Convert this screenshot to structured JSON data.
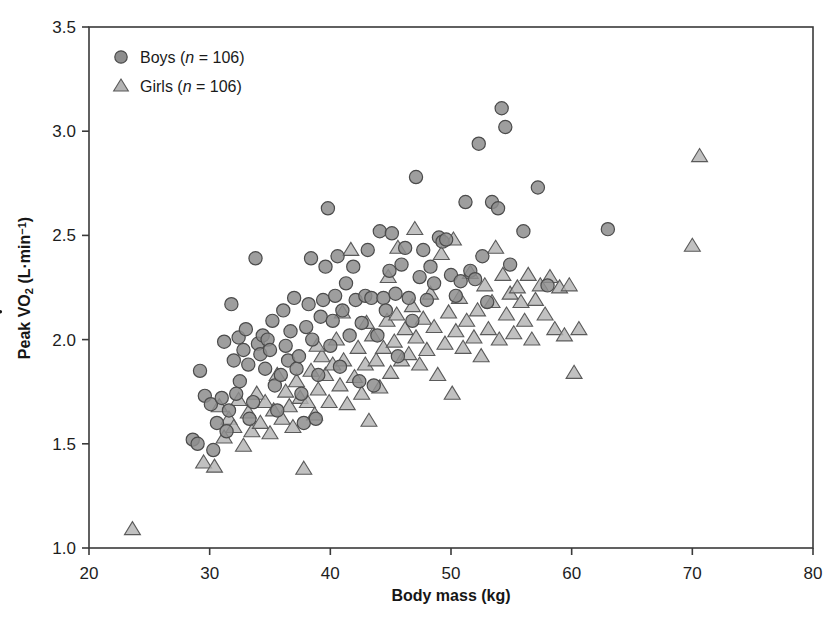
{
  "chart_data": {
    "type": "scatter",
    "title": "",
    "xlabel": "Body mass (kg)",
    "ylabel": "Peak VO2 (L·min⁻¹)",
    "ylabel_parts": {
      "prefix": "Peak ",
      "v_dot": "V",
      "o": "O",
      "sub": "2",
      "units": " (L·min",
      "exp": "−1",
      "close": ")"
    },
    "xlim": [
      20,
      80
    ],
    "ylim": [
      1.0,
      3.5
    ],
    "xticks": [
      20,
      30,
      40,
      50,
      60,
      70,
      80
    ],
    "yticks": [
      1.0,
      1.5,
      2.0,
      2.5,
      3.0,
      3.5
    ],
    "xtick_labels": [
      "20",
      "30",
      "40",
      "50",
      "60",
      "70",
      "80"
    ],
    "ytick_labels": [
      "1.0",
      "1.5",
      "2.0",
      "2.5",
      "3.0",
      "3.5"
    ],
    "grid": false,
    "legend_position": "top-left",
    "marker_colors": {
      "boys_fill": "#8d8d8d",
      "boys_edge": "#4b4b4b",
      "girls_fill": "#b3b3b3",
      "girls_edge": "#5a5a5a",
      "frame": "#3a3a3a"
    },
    "series": [
      {
        "name": "Boys",
        "n": 106,
        "legend_label_prefix": "Boys (",
        "legend_label_italic": "n",
        "legend_label_suffix": " = 106)",
        "marker": "circle",
        "points": [
          [
            28.6,
            1.52
          ],
          [
            29.0,
            1.5
          ],
          [
            29.2,
            1.85
          ],
          [
            29.6,
            1.73
          ],
          [
            30.1,
            1.69
          ],
          [
            30.3,
            1.47
          ],
          [
            30.6,
            1.6
          ],
          [
            31.0,
            1.72
          ],
          [
            31.2,
            1.99
          ],
          [
            31.4,
            1.56
          ],
          [
            31.6,
            1.66
          ],
          [
            31.8,
            2.17
          ],
          [
            32.0,
            1.9
          ],
          [
            32.2,
            1.74
          ],
          [
            32.4,
            2.01
          ],
          [
            32.5,
            1.8
          ],
          [
            32.8,
            1.95
          ],
          [
            33.0,
            2.05
          ],
          [
            33.2,
            1.88
          ],
          [
            33.3,
            1.62
          ],
          [
            33.6,
            1.7
          ],
          [
            33.8,
            2.39
          ],
          [
            34.0,
            1.98
          ],
          [
            34.2,
            1.93
          ],
          [
            34.4,
            2.02
          ],
          [
            34.6,
            1.86
          ],
          [
            34.8,
            2.0
          ],
          [
            35.0,
            1.95
          ],
          [
            35.2,
            2.09
          ],
          [
            35.4,
            1.78
          ],
          [
            35.6,
            1.66
          ],
          [
            35.9,
            1.83
          ],
          [
            36.1,
            2.14
          ],
          [
            36.3,
            1.97
          ],
          [
            36.5,
            1.9
          ],
          [
            36.7,
            2.04
          ],
          [
            37.0,
            2.2
          ],
          [
            37.2,
            1.86
          ],
          [
            37.4,
            1.92
          ],
          [
            37.6,
            1.74
          ],
          [
            37.8,
            1.6
          ],
          [
            38.0,
            2.06
          ],
          [
            38.2,
            2.17
          ],
          [
            38.4,
            2.39
          ],
          [
            38.5,
            2.0
          ],
          [
            38.8,
            1.62
          ],
          [
            39.0,
            1.83
          ],
          [
            39.2,
            2.11
          ],
          [
            39.4,
            2.19
          ],
          [
            39.6,
            2.35
          ],
          [
            39.8,
            2.63
          ],
          [
            40.0,
            1.97
          ],
          [
            40.2,
            2.09
          ],
          [
            40.4,
            2.21
          ],
          [
            40.6,
            2.4
          ],
          [
            40.8,
            1.87
          ],
          [
            41.0,
            2.14
          ],
          [
            41.3,
            2.27
          ],
          [
            41.6,
            2.02
          ],
          [
            41.9,
            2.35
          ],
          [
            42.1,
            2.19
          ],
          [
            42.4,
            1.8
          ],
          [
            42.6,
            2.08
          ],
          [
            42.9,
            2.21
          ],
          [
            43.1,
            2.43
          ],
          [
            43.4,
            2.2
          ],
          [
            43.6,
            1.78
          ],
          [
            43.9,
            2.02
          ],
          [
            44.1,
            2.52
          ],
          [
            44.4,
            2.2
          ],
          [
            44.6,
            2.14
          ],
          [
            44.9,
            2.33
          ],
          [
            45.1,
            2.51
          ],
          [
            45.4,
            2.22
          ],
          [
            45.6,
            1.92
          ],
          [
            45.9,
            2.36
          ],
          [
            46.2,
            2.44
          ],
          [
            46.5,
            2.2
          ],
          [
            46.8,
            2.09
          ],
          [
            47.1,
            2.78
          ],
          [
            47.4,
            2.3
          ],
          [
            47.7,
            2.43
          ],
          [
            48.0,
            2.19
          ],
          [
            48.3,
            2.35
          ],
          [
            48.6,
            2.27
          ],
          [
            49.0,
            2.49
          ],
          [
            49.3,
            2.47
          ],
          [
            49.6,
            2.48
          ],
          [
            50.0,
            2.31
          ],
          [
            50.4,
            2.21
          ],
          [
            50.8,
            2.28
          ],
          [
            51.2,
            2.66
          ],
          [
            51.6,
            2.33
          ],
          [
            52.0,
            2.29
          ],
          [
            52.3,
            2.94
          ],
          [
            52.6,
            2.4
          ],
          [
            53.0,
            2.18
          ],
          [
            53.4,
            2.66
          ],
          [
            53.9,
            2.63
          ],
          [
            54.2,
            3.11
          ],
          [
            54.5,
            3.02
          ],
          [
            54.9,
            2.36
          ],
          [
            56.0,
            2.52
          ],
          [
            57.2,
            2.73
          ],
          [
            58.0,
            2.26
          ],
          [
            63.0,
            2.53
          ]
        ]
      },
      {
        "name": "Girls",
        "n": 106,
        "legend_label_prefix": "Girls (",
        "legend_label_italic": "n",
        "legend_label_suffix": " = 106)",
        "marker": "triangle",
        "points": [
          [
            23.6,
            1.09
          ],
          [
            29.5,
            1.41
          ],
          [
            30.4,
            1.39
          ],
          [
            30.8,
            1.68
          ],
          [
            31.2,
            1.53
          ],
          [
            31.6,
            1.62
          ],
          [
            32.0,
            1.58
          ],
          [
            32.4,
            1.71
          ],
          [
            32.8,
            1.49
          ],
          [
            33.2,
            1.65
          ],
          [
            33.5,
            1.56
          ],
          [
            33.9,
            1.74
          ],
          [
            34.2,
            1.6
          ],
          [
            34.6,
            1.7
          ],
          [
            35.0,
            1.55
          ],
          [
            35.3,
            1.66
          ],
          [
            35.6,
            1.83
          ],
          [
            36.0,
            1.62
          ],
          [
            36.3,
            1.75
          ],
          [
            36.6,
            1.68
          ],
          [
            36.9,
            1.58
          ],
          [
            37.2,
            1.8
          ],
          [
            37.5,
            1.72
          ],
          [
            37.8,
            1.38
          ],
          [
            38.1,
            1.7
          ],
          [
            38.4,
            1.85
          ],
          [
            38.7,
            1.64
          ],
          [
            39.0,
            1.76
          ],
          [
            39.3,
            1.92
          ],
          [
            39.6,
            1.83
          ],
          [
            39.9,
            1.7
          ],
          [
            40.2,
            1.88
          ],
          [
            40.5,
            2.0
          ],
          [
            40.8,
            1.78
          ],
          [
            41.1,
            1.9
          ],
          [
            41.4,
            1.69
          ],
          [
            41.7,
            2.43
          ],
          [
            42.0,
            1.82
          ],
          [
            42.3,
            1.96
          ],
          [
            42.6,
            1.74
          ],
          [
            42.9,
            1.88
          ],
          [
            43.2,
            1.61
          ],
          [
            43.5,
            2.02
          ],
          [
            43.8,
            1.9
          ],
          [
            44.1,
            1.77
          ],
          [
            44.4,
            1.96
          ],
          [
            44.7,
            2.09
          ],
          [
            45.0,
            1.84
          ],
          [
            45.3,
            1.99
          ],
          [
            45.6,
            2.44
          ],
          [
            45.9,
            1.9
          ],
          [
            46.2,
            2.05
          ],
          [
            46.5,
            1.93
          ],
          [
            46.8,
            2.16
          ],
          [
            47.1,
            2.01
          ],
          [
            47.4,
            1.88
          ],
          [
            47.7,
            2.1
          ],
          [
            48.0,
            1.95
          ],
          [
            48.3,
            2.22
          ],
          [
            48.6,
            2.06
          ],
          [
            48.9,
            1.83
          ],
          [
            49.2,
            2.41
          ],
          [
            49.5,
            1.98
          ],
          [
            49.8,
            2.13
          ],
          [
            50.1,
            1.74
          ],
          [
            50.4,
            2.04
          ],
          [
            50.7,
            2.2
          ],
          [
            51.0,
            1.96
          ],
          [
            51.3,
            2.09
          ],
          [
            51.6,
            2.32
          ],
          [
            51.9,
            2.01
          ],
          [
            52.2,
            2.14
          ],
          [
            52.5,
            1.92
          ],
          [
            52.8,
            2.26
          ],
          [
            53.1,
            2.05
          ],
          [
            53.4,
            2.18
          ],
          [
            53.7,
            2.44
          ],
          [
            54.0,
            2.0
          ],
          [
            54.3,
            2.31
          ],
          [
            54.6,
            2.12
          ],
          [
            54.9,
            2.22
          ],
          [
            55.2,
            2.03
          ],
          [
            55.5,
            2.25
          ],
          [
            55.8,
            2.18
          ],
          [
            56.1,
            2.09
          ],
          [
            56.4,
            2.31
          ],
          [
            56.7,
            2.0
          ],
          [
            57.0,
            2.19
          ],
          [
            57.4,
            2.26
          ],
          [
            57.8,
            2.12
          ],
          [
            58.2,
            2.3
          ],
          [
            58.6,
            2.05
          ],
          [
            59.0,
            2.25
          ],
          [
            59.4,
            2.02
          ],
          [
            59.8,
            2.26
          ],
          [
            60.2,
            1.84
          ],
          [
            60.6,
            2.05
          ],
          [
            47.0,
            2.53
          ],
          [
            50.2,
            2.48
          ],
          [
            44.8,
            2.3
          ],
          [
            43.0,
            2.08
          ],
          [
            41.0,
            2.13
          ],
          [
            45.5,
            2.12
          ],
          [
            38.9,
            1.97
          ],
          [
            70.0,
            2.45
          ],
          [
            70.6,
            2.88
          ]
        ]
      }
    ]
  },
  "figure": {
    "plot_box": {
      "left": 89,
      "top": 27,
      "right": 813,
      "bottom": 548
    }
  }
}
